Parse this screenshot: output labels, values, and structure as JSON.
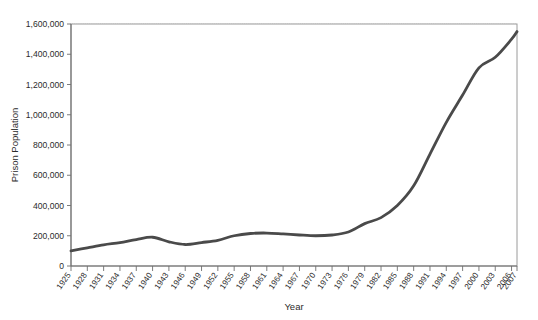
{
  "chart_data": {
    "type": "line",
    "title": "",
    "xlabel": "Year",
    "ylabel": "Prison Population",
    "xlim": [
      1925,
      2007
    ],
    "ylim": [
      0,
      1600000
    ],
    "grid": true,
    "legend": false,
    "legend_position": "none",
    "line_color": "#4a4a4a",
    "gridline_color": "#c8c8c8",
    "frame_color": "#9a9a9a",
    "background_color": "#ffffff",
    "ytick_labels": [
      "0",
      "200,000",
      "400,000",
      "600,000",
      "800,000",
      "1,000,000",
      "1,200,000",
      "1,400,000",
      "1,600,000"
    ],
    "ytick_values": [
      0,
      200000,
      400000,
      600000,
      800000,
      1000000,
      1200000,
      1400000,
      1600000
    ],
    "xtick_labels": [
      "1925",
      "1928",
      "1931",
      "1934",
      "1937",
      "1940",
      "1943",
      "1946",
      "1949",
      "1952",
      "1955",
      "1958",
      "1961",
      "1964",
      "1967",
      "1970",
      "1973",
      "1976",
      "1979",
      "1982",
      "1985",
      "1988",
      "1991",
      "1994",
      "1997",
      "2000",
      "2003",
      "2006",
      "2007"
    ],
    "xtick_values": [
      1925,
      1928,
      1931,
      1934,
      1937,
      1940,
      1943,
      1946,
      1949,
      1952,
      1955,
      1958,
      1961,
      1964,
      1967,
      1970,
      1973,
      1976,
      1979,
      1982,
      1985,
      1988,
      1991,
      1994,
      1997,
      2000,
      2003,
      2006,
      2007
    ],
    "x": [
      1925,
      1928,
      1931,
      1934,
      1937,
      1940,
      1943,
      1946,
      1949,
      1952,
      1955,
      1958,
      1961,
      1964,
      1967,
      1970,
      1973,
      1976,
      1979,
      1982,
      1985,
      1988,
      1991,
      1994,
      1997,
      2000,
      2003,
      2006,
      2007
    ],
    "values": [
      100000,
      120000,
      140000,
      155000,
      175000,
      190000,
      160000,
      142000,
      155000,
      170000,
      200000,
      215000,
      218000,
      212000,
      205000,
      200000,
      205000,
      225000,
      280000,
      320000,
      400000,
      530000,
      740000,
      950000,
      1130000,
      1310000,
      1380000,
      1500000,
      1550000
    ],
    "series": [
      {
        "name": "Prison Population",
        "values": [
          100000,
          120000,
          140000,
          155000,
          175000,
          190000,
          160000,
          142000,
          155000,
          170000,
          200000,
          215000,
          218000,
          212000,
          205000,
          200000,
          205000,
          225000,
          280000,
          320000,
          400000,
          530000,
          740000,
          950000,
          1130000,
          1310000,
          1380000,
          1500000,
          1550000
        ]
      }
    ],
    "annotations": []
  }
}
